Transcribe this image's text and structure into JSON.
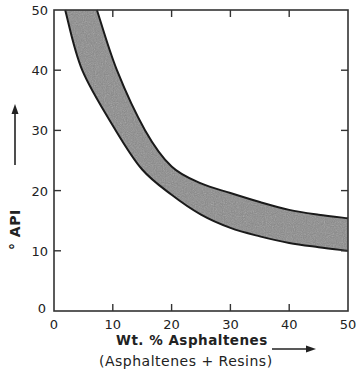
{
  "chart_data": {
    "type": "area",
    "title": "",
    "xlabel": "Wt. % Asphaltenes",
    "xlabel_line2": "(Asphaltenes + Resins)",
    "ylabel": "° API",
    "xlim": [
      0,
      50
    ],
    "ylim": [
      0,
      50
    ],
    "x_ticks": [
      0,
      10,
      20,
      30,
      40,
      50
    ],
    "y_ticks": [
      0,
      10,
      20,
      30,
      40,
      50
    ],
    "grid": false,
    "legend": null,
    "series": [
      {
        "name": "band upper boundary",
        "x": [
          7.3,
          10.7,
          15.5,
          20,
          25,
          30,
          35,
          40,
          45,
          50
        ],
        "y": [
          50,
          40,
          30,
          24,
          21.2,
          19.6,
          18.1,
          16.8,
          16.0,
          15.4
        ]
      },
      {
        "name": "band lower boundary",
        "x": [
          1.9,
          4.8,
          10.5,
          15,
          20,
          25,
          30,
          35,
          40,
          45,
          50
        ],
        "y": [
          50,
          40,
          30,
          23.5,
          19.3,
          16.0,
          13.8,
          12.4,
          11.3,
          10.6,
          10.0
        ]
      }
    ],
    "band_fill": "#8a8a8a",
    "line_color": "#1a1a1a"
  }
}
